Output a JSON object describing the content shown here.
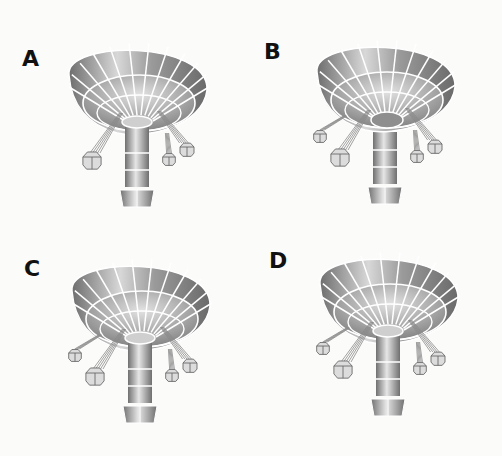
{
  "puzzle": {
    "type": "odd-one-out",
    "subject": "swing carousel ride",
    "colors": {
      "background": "#fbfbfa",
      "label": "#111111",
      "canopy_light": "#e9e9e9",
      "canopy_dark": "#7a7a7a",
      "grid_lines": "#ffffff",
      "chains": "#8a8a8a"
    }
  },
  "panels": [
    {
      "label": "A",
      "pos": {
        "x": 0,
        "y": 0
      },
      "label_pos": {
        "x": 22,
        "y": 48
      },
      "ride": {
        "cx": 137,
        "cy": 95,
        "show_collar": true,
        "left_outer_seat": false
      }
    },
    {
      "label": "B",
      "pos": {
        "x": 251,
        "y": 0
      },
      "label_pos": {
        "x": 13,
        "y": 41
      },
      "ride": {
        "cx": 134,
        "cy": 92,
        "show_collar": false,
        "left_outer_seat": true
      }
    },
    {
      "label": "C",
      "pos": {
        "x": 0,
        "y": 228
      },
      "label_pos": {
        "x": 24,
        "y": 30
      },
      "ride": {
        "cx": 140,
        "cy": 83,
        "show_collar": true,
        "left_outer_seat": true
      }
    },
    {
      "label": "D",
      "pos": {
        "x": 251,
        "y": 228
      },
      "label_pos": {
        "x": 18,
        "y": 22
      },
      "ride": {
        "cx": 137,
        "cy": 76,
        "show_collar": true,
        "left_outer_seat": true
      }
    }
  ]
}
